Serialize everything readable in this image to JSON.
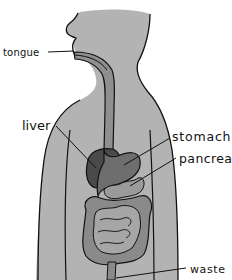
{
  "diagram": {
    "labels": {
      "tongue": "tongue",
      "liver": "liver",
      "stomach": "stomach",
      "pancreas": "pancreas",
      "waste": "waste"
    },
    "colors": {
      "body": "#b3b3b3",
      "esophagus": "#8f8f8f",
      "liver": "#4a4a4a",
      "stomach": "#6e6e6e",
      "pancreas": "#9a9a9a",
      "large_intestine": "#8a8a8a",
      "small_intestine": "#a6a6a6",
      "outline": "#111111"
    }
  }
}
